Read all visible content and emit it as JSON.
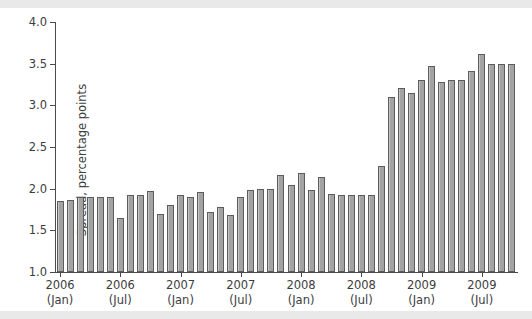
{
  "chart_data": {
    "type": "bar",
    "title": "",
    "xlabel": "",
    "ylabel": "Spread, percentage points",
    "ylim": [
      1.0,
      4.0
    ],
    "yticks": [
      "1.0",
      "1.5",
      "2.0",
      "2.5",
      "3.0",
      "3.5",
      "4.0"
    ],
    "ytick_values": [
      1.0,
      1.5,
      2.0,
      2.5,
      3.0,
      3.5,
      4.0
    ],
    "grid": false,
    "legend": null,
    "bar_color": "#a3a3a3",
    "bar_edge_color": "#5c5c5c",
    "axis_color": "#4a4a4a",
    "background": "#ffffff",
    "page_background": "#e9e9e9",
    "xtick_labels": [
      {
        "line1": "2006",
        "line2": "(Jan)",
        "index": 0
      },
      {
        "line1": "2006",
        "line2": "(Jul)",
        "index": 6
      },
      {
        "line1": "2007",
        "line2": "(Jan)",
        "index": 12
      },
      {
        "line1": "2007",
        "line2": "(Jul)",
        "index": 18
      },
      {
        "line1": "2008",
        "line2": "(Jan)",
        "index": 24
      },
      {
        "line1": "2008",
        "line2": "(Jul)",
        "index": 30
      },
      {
        "line1": "2009",
        "line2": "(Jan)",
        "index": 36
      },
      {
        "line1": "2009",
        "line2": "(Jul)",
        "index": 42
      }
    ],
    "categories": [
      "2006-01",
      "2006-02",
      "2006-03",
      "2006-04",
      "2006-05",
      "2006-06",
      "2006-07",
      "2006-08",
      "2006-09",
      "2006-10",
      "2006-11",
      "2006-12",
      "2007-01",
      "2007-02",
      "2007-03",
      "2007-04",
      "2007-05",
      "2007-06",
      "2007-07",
      "2007-08",
      "2007-09",
      "2007-10",
      "2007-11",
      "2007-12",
      "2008-01",
      "2008-02",
      "2008-03",
      "2008-04",
      "2008-05",
      "2008-06",
      "2008-07",
      "2008-08",
      "2008-09",
      "2008-10",
      "2008-11",
      "2008-12",
      "2009-01",
      "2009-02",
      "2009-03",
      "2009-04",
      "2009-05",
      "2009-06",
      "2009-07",
      "2009-08",
      "2009-09",
      "2009-10"
    ],
    "values": [
      1.85,
      1.86,
      1.9,
      1.9,
      1.9,
      1.9,
      1.65,
      1.92,
      1.93,
      1.97,
      1.7,
      1.8,
      1.92,
      1.9,
      1.96,
      1.72,
      1.78,
      1.68,
      1.9,
      1.99,
      2.0,
      2.0,
      2.16,
      2.05,
      2.19,
      1.98,
      2.14,
      1.94,
      1.92,
      1.92,
      1.92,
      1.92,
      2.27,
      3.1,
      3.21,
      3.15,
      3.31,
      3.47,
      3.28,
      3.31,
      3.31,
      3.41,
      3.62,
      3.5,
      3.5,
      3.5
    ]
  }
}
